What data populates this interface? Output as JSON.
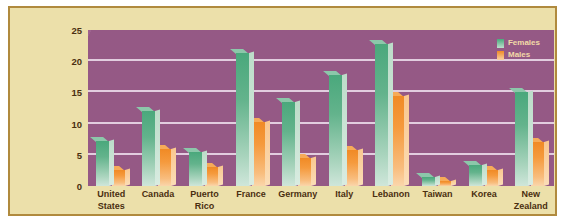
{
  "chart_data": {
    "type": "bar",
    "title": "",
    "xlabel": "",
    "ylabel": "Percentage of Adults Experiencing Depression at Some Time in Life",
    "ylim": [
      0,
      25
    ],
    "yticks": [
      0,
      5,
      10,
      15,
      20,
      25
    ],
    "grid": true,
    "legend_position": "top-right",
    "categories": [
      "United States",
      "Canada",
      "Puerto Rico",
      "France",
      "Germany",
      "Italy",
      "Lebanon",
      "Taiwan",
      "Korea",
      "New Zealand"
    ],
    "series": [
      {
        "name": "Females",
        "color": "#5cae85",
        "values": [
          7.2,
          12.0,
          5.4,
          21.3,
          13.5,
          17.8,
          22.8,
          1.5,
          3.4,
          15.0
        ]
      },
      {
        "name": "Males",
        "color": "#f2912c",
        "values": [
          2.6,
          6.0,
          3.0,
          10.3,
          4.5,
          5.8,
          14.5,
          0.8,
          2.5,
          7.0
        ]
      }
    ]
  },
  "legend": {
    "items": [
      {
        "label": "Females"
      },
      {
        "label": "Males"
      }
    ]
  },
  "colors": {
    "panel_background": "#ece0aa",
    "panel_border": "#b08a3e",
    "plot_background": "#9a5c8a",
    "gridline": "#f0e2ef",
    "females": "#5cae85",
    "males": "#f2912c",
    "label_text": "#4a2f10",
    "legend_text": "#f2d9a8"
  }
}
